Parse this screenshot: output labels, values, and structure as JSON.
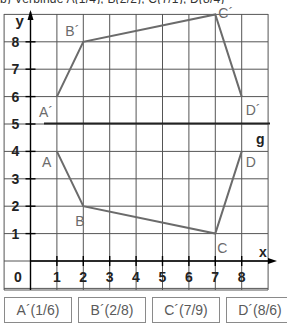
{
  "task_header": "b) Verbinde A(1/4), B(2/2), C(7/1), D(8/4)",
  "diagram": {
    "axis": {
      "x_label": "x",
      "y_label": "y",
      "origin_label": "0",
      "x_ticks": [
        "1",
        "2",
        "3",
        "4",
        "5",
        "6",
        "7",
        "8"
      ],
      "y_ticks": [
        "1",
        "2",
        "3",
        "4",
        "5",
        "6",
        "7",
        "8"
      ]
    },
    "mirror_line": {
      "label": "g",
      "y": 5
    },
    "original": {
      "points": [
        {
          "label": "A",
          "x": 1,
          "y": 4
        },
        {
          "label": "B",
          "x": 2,
          "y": 2
        },
        {
          "label": "C",
          "x": 7,
          "y": 1
        },
        {
          "label": "D",
          "x": 8,
          "y": 4
        }
      ]
    },
    "image": {
      "points": [
        {
          "label": "A´",
          "x": 1,
          "y": 6
        },
        {
          "label": "B´",
          "x": 2,
          "y": 8
        },
        {
          "label": "C´",
          "x": 7,
          "y": 9
        },
        {
          "label": "D´",
          "x": 8,
          "y": 6
        }
      ]
    },
    "colors": {
      "grid": "#555555",
      "shape": "#6b6b6b",
      "label": "#6b6b6b",
      "axis": "#000000"
    }
  },
  "answers": [
    {
      "label": "A´(1/6)"
    },
    {
      "label": "B´(2/8)"
    },
    {
      "label": "C´(7/9)"
    },
    {
      "label": "D´(8/6)"
    }
  ]
}
